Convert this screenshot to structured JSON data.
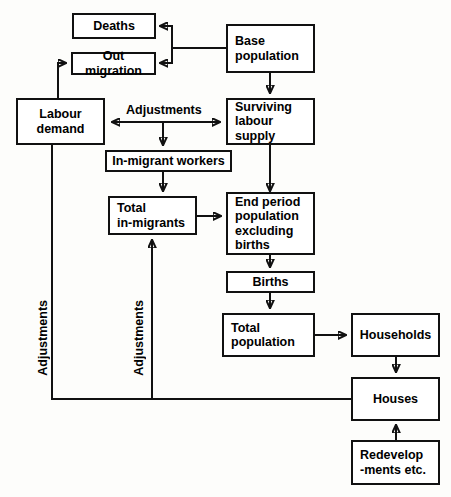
{
  "diagram": {
    "line_color": "#111111",
    "box_fill": "#ffffff",
    "background": "#fdfdfb"
  },
  "nodes": {
    "deaths": {
      "label": "Deaths"
    },
    "out_migration": {
      "label": "Out migration"
    },
    "base_population": {
      "label": "Base\npopulation"
    },
    "labour_demand": {
      "label": "Labour\ndemand"
    },
    "surviving_labour_supply": {
      "label": "Surviving\nlabour\nsupply"
    },
    "in_migrant_workers": {
      "label": "In-migrant workers"
    },
    "total_in_migrants": {
      "label": "Total\nin-migrants"
    },
    "end_period_population": {
      "label": "End period\npopulation\nexcluding\nbirths"
    },
    "births": {
      "label": "Births"
    },
    "total_population": {
      "label": "Total\npopulation"
    },
    "households": {
      "label": "Households"
    },
    "houses": {
      "label": "Houses"
    },
    "redevelopments": {
      "label": "Redevelop\n-ments etc."
    }
  },
  "edge_labels": {
    "adjustments_top": "Adjustments",
    "adjustments_left": "Adjustments",
    "adjustments_middle": "Adjustments"
  }
}
